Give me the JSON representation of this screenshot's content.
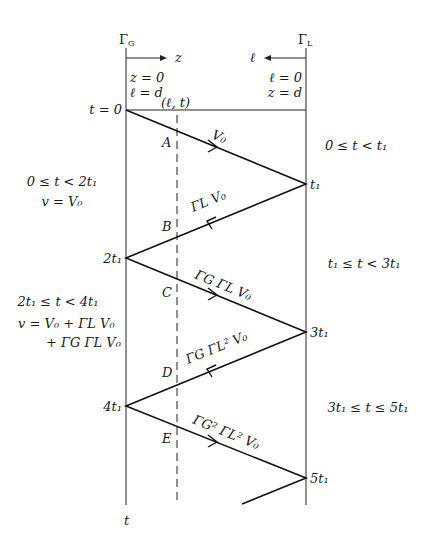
{
  "boundaries": {
    "generator": {
      "label": "Γ",
      "sub": "G",
      "coord_label_1": "z = 0",
      "coord_label_2": "ℓ = d",
      "axis_label": "z"
    },
    "load": {
      "label": "Γ",
      "sub": "L",
      "coord_label_1": "ℓ = 0",
      "coord_label_2": "z = d",
      "axis_label": "ℓ"
    }
  },
  "observation_point": "(ℓ, t)",
  "time_axis_label": "t",
  "time_marks": {
    "t0": "t = 0",
    "t1": "t₁",
    "t2": "2t₁",
    "t3": "3t₁",
    "t4": "4t₁",
    "t5": "5t₁"
  },
  "waves": [
    {
      "label": "V₀",
      "direction": "forward"
    },
    {
      "label": "ΓL V₀",
      "direction": "backward"
    },
    {
      "label": "ΓG ΓL V₀",
      "direction": "forward"
    },
    {
      "label": "ΓG ΓL² V₀",
      "direction": "backward"
    },
    {
      "label": "ΓG² ΓL² V₀",
      "direction": "forward"
    }
  ],
  "crossing_points": [
    "A",
    "B",
    "C",
    "D",
    "E"
  ],
  "left_annotations": {
    "interval1": "0 ≤ t < 2t₁",
    "voltage1": "v = V₀",
    "interval2": "2t₁ ≤ t < 4t₁",
    "voltage2_line1": "v = V₀ + ΓL V₀",
    "voltage2_line2": "+ ΓG ΓL V₀"
  },
  "right_annotations": {
    "interval1": "0 ≤ t < t₁",
    "interval2": "t₁ ≤ t < 3t₁",
    "interval3": "3t₁ ≤ t ≤ 5t₁"
  }
}
